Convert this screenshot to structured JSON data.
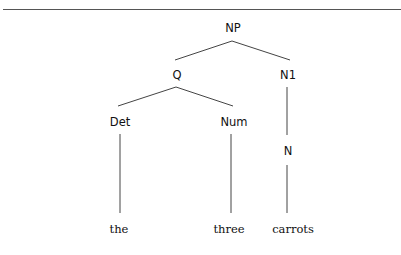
{
  "tree": {
    "nodes": {
      "np": "NP",
      "q": "Q",
      "n1": "N1",
      "det": "Det",
      "num": "Num",
      "n": "N"
    },
    "leaves": {
      "the": "the",
      "three": "three",
      "carrots": "carrots"
    },
    "edges": [
      [
        "NP",
        "Q"
      ],
      [
        "NP",
        "N1"
      ],
      [
        "Q",
        "Det"
      ],
      [
        "Q",
        "Num"
      ],
      [
        "N1",
        "N"
      ],
      [
        "Det",
        "the"
      ],
      [
        "Num",
        "three"
      ],
      [
        "N",
        "carrots"
      ]
    ]
  }
}
